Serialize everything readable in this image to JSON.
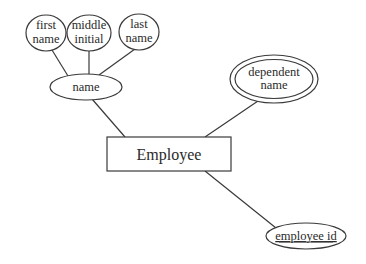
{
  "diagram": {
    "type": "er-diagram",
    "entity": {
      "name": "Employee"
    },
    "attributes": {
      "name": {
        "label": "name",
        "kind": "composite"
      },
      "first_name": {
        "line1": "first",
        "line2": "name",
        "kind": "simple",
        "parent": "name"
      },
      "middle_initial": {
        "line1": "middle",
        "line2": "initial",
        "kind": "simple",
        "parent": "name"
      },
      "last_name": {
        "line1": "last",
        "line2": "name",
        "kind": "simple",
        "parent": "name"
      },
      "dependent_name": {
        "line1": "dependent",
        "line2": "name",
        "kind": "multivalued"
      },
      "employee_id": {
        "label": "employee id",
        "kind": "key"
      }
    },
    "colors": {
      "stroke": "#3a3a3a",
      "text": "#2a2a2a",
      "background": "#ffffff"
    }
  }
}
